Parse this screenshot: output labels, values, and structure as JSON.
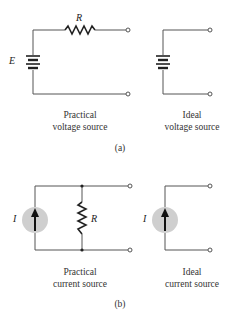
{
  "figure": {
    "panel_a": {
      "caption": "(a)",
      "practical": {
        "title_line1": "Practical",
        "title_line2": "voltage source",
        "source_label": "E",
        "resistor_label": "R"
      },
      "ideal": {
        "title_line1": "Ideal",
        "title_line2": "voltage source"
      }
    },
    "panel_b": {
      "caption": "(b)",
      "practical": {
        "title_line1": "Practical",
        "title_line2": "current source",
        "source_label": "I",
        "resistor_label": "R"
      },
      "ideal": {
        "title_line1": "Ideal",
        "title_line2": "current source",
        "source_label": "I"
      }
    },
    "colors": {
      "wire": "#555555",
      "source_fill": "#cfcfcf",
      "arrow": "#111111"
    }
  }
}
